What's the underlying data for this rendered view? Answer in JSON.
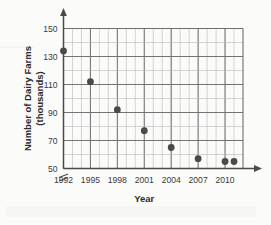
{
  "chart_data": {
    "type": "scatter",
    "title": "",
    "xlabel": "Year",
    "ylabel": "Number of Dairy Farms (thousands)",
    "ylabel_line1": "Number of Dairy Farms",
    "ylabel_line2": "(thousands)",
    "x": [
      1992,
      1995,
      1998,
      2001,
      2004,
      2007,
      2010,
      2011
    ],
    "values": [
      134,
      112,
      92,
      77,
      65,
      57,
      55,
      55
    ],
    "points": [
      {
        "x": 1992,
        "y": 134
      },
      {
        "x": 1995,
        "y": 112
      },
      {
        "x": 1998,
        "y": 92
      },
      {
        "x": 2001,
        "y": 77
      },
      {
        "x": 2004,
        "y": 65
      },
      {
        "x": 2007,
        "y": 57
      },
      {
        "x": 2010,
        "y": 55
      },
      {
        "x": 2011,
        "y": 55
      }
    ],
    "xticks": [
      1992,
      1995,
      1998,
      2001,
      2004,
      2007,
      2010
    ],
    "xtick_labels": [
      "1992",
      "1995",
      "1998",
      "2001",
      "2004",
      "2007",
      "2010"
    ],
    "yticks": [
      50,
      70,
      90,
      110,
      130,
      150
    ],
    "ytick_labels": [
      "50",
      "70",
      "90",
      "110",
      "130",
      "150"
    ],
    "xlim": [
      1992,
      2012
    ],
    "ylim": [
      50,
      150
    ],
    "y_minor_step": 10,
    "x_minor_step": 1,
    "grid": true,
    "legend": "none",
    "y_axis_break": true,
    "axis_arrows": [
      "x-right",
      "y-top"
    ],
    "marker_color": "#4a4a4a",
    "grid_color_minor": "#b9b9b9",
    "grid_color_major": "#6e6e6e",
    "background_color": "#fbfbf9"
  }
}
